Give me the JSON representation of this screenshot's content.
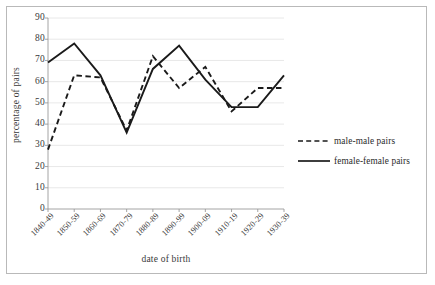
{
  "chart_data": {
    "type": "line",
    "title": "",
    "xlabel": "date of birth",
    "ylabel": "percentage of pairs",
    "categories": [
      "1840-49",
      "1850-59",
      "1860-69",
      "1870-79",
      "1880-89",
      "1890-99",
      "1900-09",
      "1910-19",
      "1920-29",
      "1930-39"
    ],
    "series": [
      {
        "name": "male-male pairs",
        "style": "dashed",
        "color": "#1a1a1a",
        "values": [
          28,
          63,
          62,
          37,
          72,
          57,
          67,
          46,
          57,
          57
        ]
      },
      {
        "name": "female-female pairs",
        "style": "solid",
        "color": "#1a1a1a",
        "values": [
          69,
          78,
          63,
          36,
          66,
          77,
          61,
          48,
          48,
          63
        ]
      }
    ],
    "ylim": [
      0,
      90
    ],
    "ytick_step": 10,
    "yticks": [
      "0",
      "10",
      "20",
      "30",
      "40",
      "50",
      "60",
      "70",
      "80",
      "90"
    ],
    "grid": "horizontal",
    "legend_position": "right"
  },
  "legend": {
    "items": [
      {
        "label": "male-male pairs",
        "style": "dashed"
      },
      {
        "label": "female-female pairs",
        "style": "solid"
      }
    ]
  }
}
